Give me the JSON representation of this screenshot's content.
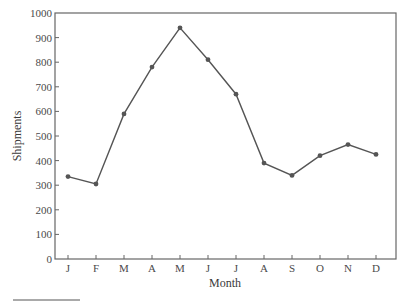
{
  "chart_data": {
    "type": "line",
    "title": "",
    "xlabel": "Month",
    "ylabel": "Shipments",
    "categories": [
      "J",
      "F",
      "M",
      "A",
      "M",
      "J",
      "J",
      "A",
      "S",
      "O",
      "N",
      "D"
    ],
    "series": [
      {
        "name": "Shipments",
        "values": [
          335,
          305,
          590,
          780,
          940,
          810,
          670,
          390,
          340,
          420,
          465,
          425
        ]
      }
    ],
    "ylim": [
      0,
      1000
    ],
    "yticks": [
      0,
      100,
      200,
      300,
      400,
      500,
      600,
      700,
      800,
      900,
      1000
    ],
    "grid": false,
    "legend": null,
    "markers": true,
    "line_color": "#555555",
    "frame_color": "#666666"
  }
}
